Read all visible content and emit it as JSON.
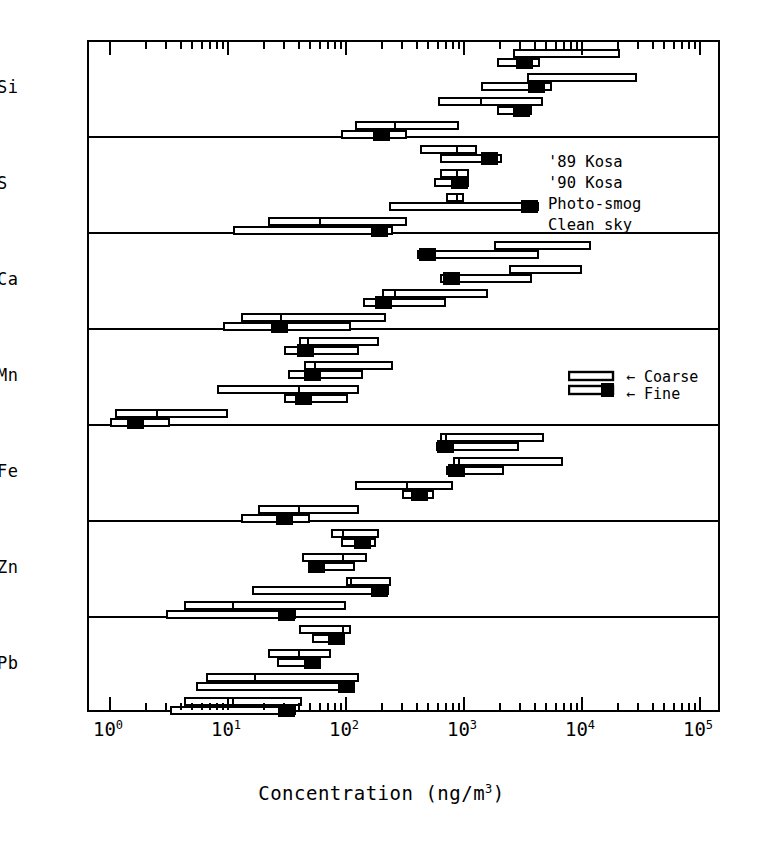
{
  "figure": {
    "xlabel_html": "Concentration (ng/m<sup>3</sup>)",
    "xlabel_text": "Concentration (ng/m3)"
  },
  "legend_conditions": {
    "items": [
      {
        "label": "'89 Kosa"
      },
      {
        "label": "'90 Kosa"
      },
      {
        "label": "Photo-smog"
      },
      {
        "label": "Clean sky"
      }
    ]
  },
  "legend_size": {
    "coarse_label": "Coarse",
    "fine_label": "Fine",
    "arrow": "←"
  },
  "axis": {
    "tick_labels": [
      "10<sup>0</sup>",
      "10<sup>1</sup>",
      "10<sup>2</sup>",
      "10<sup>3</sup>",
      "10<sup>4</sup>",
      "10<sup>5</sup>"
    ],
    "tick_values": [
      1,
      10,
      100,
      1000,
      10000,
      100000
    ],
    "scale": "log",
    "xmin": 1,
    "xmax": 100000
  },
  "chart_data": {
    "type": "bar",
    "subtype": "horizontal-range-bars-log",
    "title": "",
    "xlabel": "Concentration (ng/m3)",
    "ylabel": "",
    "xscale": "log",
    "xlim": [
      1,
      100000
    ],
    "grid": false,
    "legend_position": "inside-upper-right",
    "series_names": [
      "'89 Kosa",
      "'90 Kosa",
      "Photo-smog",
      "Clean sky"
    ],
    "size_fractions": [
      "Coarse",
      "Fine"
    ],
    "note": "Each element row shows four condition groups; each group has a Coarse range bar (upper, open) and a Fine range bar (lower, with solid marker). Values are concentration ranges in ng/m3 read off the log axis.",
    "elements": [
      {
        "element": "Si",
        "groups": [
          {
            "condition": "'89 Kosa",
            "coarse": {
              "min": 2600,
              "max": 21000,
              "median": 2600
            },
            "fine": {
              "min": 1900,
              "max": 4400,
              "median": 3000,
              "marker": 3000,
              "marker_side": "left"
            }
          },
          {
            "condition": "'90 Kosa",
            "coarse": {
              "min": 3400,
              "max": 29000,
              "median": 3400
            },
            "fine": {
              "min": 1400,
              "max": 5600,
              "median": 4100,
              "marker": 4100,
              "marker_side": "mid"
            }
          },
          {
            "condition": "Photo-smog",
            "coarse": {
              "min": 600,
              "max": 4700,
              "median": 1400
            },
            "fine": {
              "min": 1900,
              "max": 3800,
              "median": 2800,
              "marker": 2800,
              "marker_side": "left"
            }
          },
          {
            "condition": "Clean sky",
            "coarse": {
              "min": 120,
              "max": 900,
              "median": 260
            },
            "fine": {
              "min": 90,
              "max": 330,
              "median": 200,
              "marker": 200,
              "marker_side": "mid"
            }
          }
        ]
      },
      {
        "element": "S",
        "groups": [
          {
            "condition": "'89 Kosa",
            "coarse": {
              "min": 420,
              "max": 1300,
              "median": 880
            },
            "fine": {
              "min": 620,
              "max": 2100,
              "median": 1800,
              "marker": 1800,
              "marker_side": "right"
            }
          },
          {
            "condition": "'90 Kosa",
            "coarse": {
              "min": 620,
              "max": 1100,
              "median": 880
            },
            "fine": {
              "min": 560,
              "max": 1100,
              "median": 1000,
              "marker": 1000,
              "marker_side": "right"
            }
          },
          {
            "condition": "Photo-smog",
            "coarse": {
              "min": 700,
              "max": 1000,
              "median": 880
            },
            "fine": {
              "min": 230,
              "max": 4300,
              "median": 3900,
              "marker": 3900,
              "marker_side": "right"
            }
          },
          {
            "condition": "Clean sky",
            "coarse": {
              "min": 22,
              "max": 330,
              "median": 60
            },
            "fine": {
              "min": 11,
              "max": 250,
              "median": 210,
              "marker": 210,
              "marker_side": "right"
            }
          }
        ]
      },
      {
        "element": "Ca",
        "groups": [
          {
            "condition": "'89 Kosa",
            "coarse": {
              "min": 1800,
              "max": 12000,
              "median": 1800
            },
            "fine": {
              "min": 400,
              "max": 4300,
              "median": 450,
              "marker": 450,
              "marker_side": "left"
            }
          },
          {
            "condition": "'90 Kosa",
            "coarse": {
              "min": 2400,
              "max": 10000,
              "median": 2400
            },
            "fine": {
              "min": 620,
              "max": 3800,
              "median": 720,
              "marker": 720,
              "marker_side": "left"
            }
          },
          {
            "condition": "Photo-smog",
            "coarse": {
              "min": 200,
              "max": 1600,
              "median": 260
            },
            "fine": {
              "min": 140,
              "max": 700,
              "median": 190,
              "marker": 190,
              "marker_side": "left"
            }
          },
          {
            "condition": "Clean sky",
            "coarse": {
              "min": 13,
              "max": 220,
              "median": 28
            },
            "fine": {
              "min": 9,
              "max": 110,
              "median": 25,
              "marker": 25,
              "marker_side": "left"
            }
          }
        ]
      },
      {
        "element": "Mn",
        "groups": [
          {
            "condition": "'89 Kosa",
            "coarse": {
              "min": 40,
              "max": 190,
              "median": 48
            },
            "fine": {
              "min": 30,
              "max": 130,
              "median": 42,
              "marker": 42,
              "marker_side": "left"
            }
          },
          {
            "condition": "'90 Kosa",
            "coarse": {
              "min": 44,
              "max": 250,
              "median": 55
            },
            "fine": {
              "min": 32,
              "max": 140,
              "median": 48,
              "marker": 48,
              "marker_side": "left"
            }
          },
          {
            "condition": "Photo-smog",
            "coarse": {
              "min": 8,
              "max": 130,
              "median": 40
            },
            "fine": {
              "min": 30,
              "max": 105,
              "median": 40,
              "marker": 40,
              "marker_side": "left"
            }
          },
          {
            "condition": "Clean sky",
            "coarse": {
              "min": 1.1,
              "max": 10,
              "median": 2.5
            },
            "fine": {
              "min": 1.0,
              "max": 3.2,
              "median": 1.5,
              "marker": 1.5,
              "marker_side": "left"
            }
          }
        ]
      },
      {
        "element": "Fe",
        "groups": [
          {
            "condition": "'89 Kosa",
            "coarse": {
              "min": 620,
              "max": 4800,
              "median": 700
            },
            "fine": {
              "min": 580,
              "max": 2900,
              "median": 640,
              "marker": 640,
              "marker_side": "left"
            }
          },
          {
            "condition": "'90 Kosa",
            "coarse": {
              "min": 800,
              "max": 6900,
              "median": 900
            },
            "fine": {
              "min": 700,
              "max": 2200,
              "median": 800,
              "marker": 800,
              "marker_side": "left"
            }
          },
          {
            "condition": "Photo-smog",
            "coarse": {
              "min": 120,
              "max": 800,
              "median": 330
            },
            "fine": {
              "min": 300,
              "max": 560,
              "median": 420,
              "marker": 420,
              "marker_side": "mid"
            }
          },
          {
            "condition": "Clean sky",
            "coarse": {
              "min": 18,
              "max": 130,
              "median": 40
            },
            "fine": {
              "min": 13,
              "max": 50,
              "median": 30,
              "marker": 30,
              "marker_side": "mid"
            }
          }
        ]
      },
      {
        "element": "Zn",
        "groups": [
          {
            "condition": "'89 Kosa",
            "coarse": {
              "min": 75,
              "max": 190,
              "median": 95
            },
            "fine": {
              "min": 90,
              "max": 180,
              "median": 150,
              "marker": 150,
              "marker_side": "right"
            }
          },
          {
            "condition": "'90 Kosa",
            "coarse": {
              "min": 42,
              "max": 150,
              "median": 95
            },
            "fine": {
              "min": 48,
              "max": 120,
              "median": 52,
              "marker": 52,
              "marker_side": "left"
            }
          },
          {
            "condition": "Photo-smog",
            "coarse": {
              "min": 100,
              "max": 240,
              "median": 110
            },
            "fine": {
              "min": 16,
              "max": 230,
              "median": 210,
              "marker": 210,
              "marker_side": "right"
            }
          },
          {
            "condition": "Clean sky",
            "coarse": {
              "min": 4.2,
              "max": 100,
              "median": 11
            },
            "fine": {
              "min": 3.0,
              "max": 38,
              "median": 34,
              "marker": 34,
              "marker_side": "right"
            }
          }
        ]
      },
      {
        "element": "Pb",
        "groups": [
          {
            "condition": "'89 Kosa",
            "coarse": {
              "min": 40,
              "max": 110,
              "median": 95
            },
            "fine": {
              "min": 52,
              "max": 98,
              "median": 90,
              "marker": 90,
              "marker_side": "right"
            }
          },
          {
            "condition": "'90 Kosa",
            "coarse": {
              "min": 22,
              "max": 75,
              "median": 40
            },
            "fine": {
              "min": 26,
              "max": 62,
              "median": 56,
              "marker": 56,
              "marker_side": "right"
            }
          },
          {
            "condition": "Photo-smog",
            "coarse": {
              "min": 6.5,
              "max": 130,
              "median": 17
            },
            "fine": {
              "min": 5.4,
              "max": 120,
              "median": 110,
              "marker": 110,
              "marker_side": "right"
            }
          },
          {
            "condition": "Clean sky",
            "coarse": {
              "min": 4.2,
              "max": 42,
              "median": 11
            },
            "fine": {
              "min": 3.2,
              "max": 38,
              "median": 34,
              "marker": 34,
              "marker_side": "right"
            }
          }
        ]
      }
    ]
  }
}
